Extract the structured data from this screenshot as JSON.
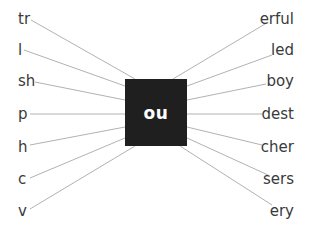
{
  "diagram": {
    "center": {
      "text": "ou",
      "box_color": "#1f1f1f",
      "text_color": "#ffffff"
    },
    "line_color": "#a8a8a8",
    "left_items": [
      {
        "label": "tr",
        "y": 19
      },
      {
        "label": "l",
        "y": 50
      },
      {
        "label": "sh",
        "y": 81
      },
      {
        "label": "p",
        "y": 114
      },
      {
        "label": "h",
        "y": 147
      },
      {
        "label": "c",
        "y": 179
      },
      {
        "label": "v",
        "y": 211
      }
    ],
    "right_items": [
      {
        "label": "erful",
        "y": 19
      },
      {
        "label": "led",
        "y": 50
      },
      {
        "label": "boy",
        "y": 81
      },
      {
        "label": "dest",
        "y": 114
      },
      {
        "label": "cher",
        "y": 147
      },
      {
        "label": "sers",
        "y": 179
      },
      {
        "label": "ery",
        "y": 211
      }
    ]
  }
}
